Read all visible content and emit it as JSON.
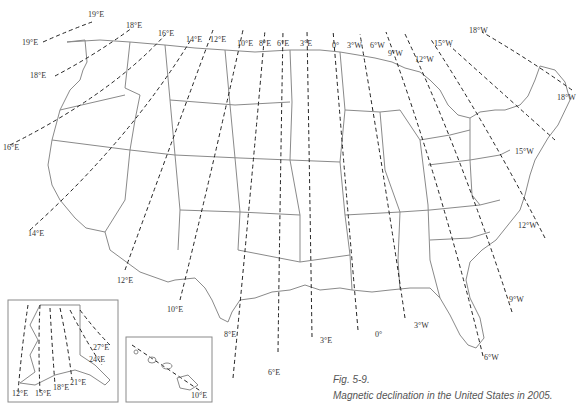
{
  "figure": {
    "number": "Fig. 5-9.",
    "caption": "Magnetic declination in the United States in 2005."
  },
  "main_map": {
    "isogonic_labels_top": [
      "19°E",
      "18°E",
      "16°E",
      "14°E",
      "12°E",
      "10°E",
      "8°E",
      "6°E",
      "3°E",
      "0°",
      "3°W",
      "6°W",
      "9°W",
      "12°W",
      "15°W",
      "18°W"
    ],
    "isogonic_labels_bottom": [
      "19°E",
      "18°E",
      "16°E",
      "14°E",
      "12°E",
      "10°E",
      "8°E",
      "6°E",
      "3°E",
      "0°",
      "3°W",
      "6°W",
      "9°W",
      "12°W",
      "15°W",
      "18°W"
    ]
  },
  "alaska_inset": {
    "labels": [
      "12°E",
      "15°E",
      "18°E",
      "21°E",
      "24°E",
      "27°E"
    ]
  },
  "hawaii_inset": {
    "labels": [
      "10°E"
    ]
  },
  "labels": {
    "e19a": "19°E",
    "e19b": "19°E",
    "e18a": "18°E",
    "e18b": "18°E",
    "e16a": "16°E",
    "e16b": "16°E",
    "e14a": "14°E",
    "e14b": "14°E",
    "e12a": "12°E",
    "e12b": "12°E",
    "e10a": "10°E",
    "e10b": "10°E",
    "e8a": "8°E",
    "e8b": "8°E",
    "e6a": "6°E",
    "e6b": "6°E",
    "e3a": "3°E",
    "e3b": "3°E",
    "z0a": "0°",
    "z0b": "0°",
    "w3a": "3°W",
    "w3b": "3°W",
    "w6a": "6°W",
    "w6b": "6°W",
    "w9a": "9°W",
    "w9b": "9°W",
    "w12a": "12°W",
    "w12b": "12°W",
    "w15a": "15°W",
    "w15b": "15°W",
    "w18a": "18°W",
    "w18b": "18°W",
    "ak12": "12°E",
    "ak15": "15°E",
    "ak18": "18°E",
    "ak21": "21°E",
    "ak24": "24°E",
    "ak27": "27°E",
    "hi10": "10°E"
  }
}
